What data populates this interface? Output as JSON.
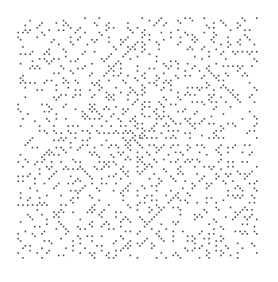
{
  "figure": {
    "kind": "ulam-prime-spiral",
    "description": "Ulam spiral: integers arranged in a square spiral, primes marked with dots",
    "grid_size": 101,
    "start_value": 1,
    "max_value": 10201,
    "canvas": {
      "width": 278,
      "height": 282
    },
    "plot_area": {
      "x0": 17,
      "y0": 17,
      "x1": 258,
      "y1": 259
    },
    "dot_size": 1.6,
    "colors": {
      "background": "#ffffff",
      "prime_dot": "#2a2a2a"
    }
  }
}
